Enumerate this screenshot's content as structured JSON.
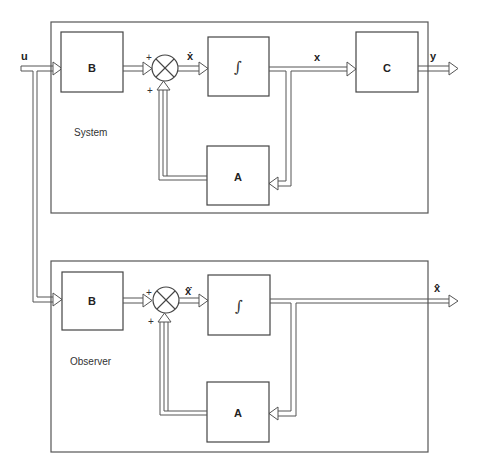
{
  "diagram": {
    "type": "block-diagram",
    "input_label": "u",
    "system": {
      "region_label": "System",
      "blocks": {
        "input_matrix": "B",
        "integrator": "∫",
        "state_matrix": "A",
        "output_matrix": "C"
      },
      "signals": {
        "state_derivative": "ẋ",
        "state": "x",
        "output": "y"
      },
      "sum_signs": [
        "+",
        "+"
      ]
    },
    "observer": {
      "region_label": "Observer",
      "blocks": {
        "input_matrix": "B",
        "integrator": "∫",
        "state_matrix": "A"
      },
      "signals": {
        "state_derivative": "x̂̇",
        "estimated_state": "x̂"
      },
      "sum_signs": [
        "+",
        "+"
      ]
    },
    "connections": [
      "u -> System.B",
      "System.B -> System.sum",
      "System.sum -> System.integrator",
      "System.integrator -> System.C",
      "System.integrator -> System.A",
      "System.A -> System.sum",
      "System.C -> y",
      "u -> Observer.B",
      "Observer.B -> Observer.sum",
      "Observer.sum -> Observer.integrator",
      "Observer.integrator -> x_hat",
      "Observer.integrator -> Observer.A",
      "Observer.A -> Observer.sum"
    ]
  }
}
